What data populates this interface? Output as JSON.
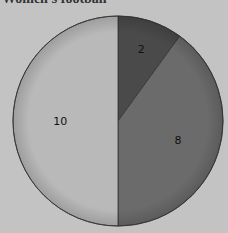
{
  "chart_data": {
    "type": "pie",
    "title": "Women's football",
    "categories": [
      "A",
      "B",
      "C"
    ],
    "values": [
      2,
      8,
      10
    ],
    "labels": [
      "2",
      "8",
      "10"
    ],
    "colors": [
      "#4a4a4a",
      "#6b6b6b",
      "#b9b9b9"
    ],
    "legend": false
  }
}
